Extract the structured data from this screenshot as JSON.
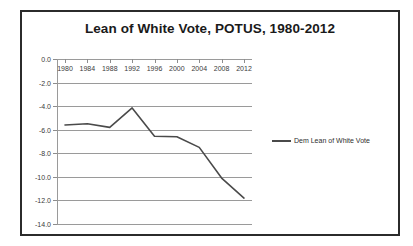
{
  "chart_data": {
    "type": "line",
    "title": "Lean of White Vote, POTUS, 1980-2012",
    "xlabel": "",
    "ylabel": "",
    "categories": [
      "1980",
      "1984",
      "1988",
      "1992",
      "1996",
      "2000",
      "2004",
      "2008",
      "2012"
    ],
    "x": [
      1980,
      1984,
      1988,
      1992,
      1996,
      2000,
      2004,
      2008,
      2012
    ],
    "series": [
      {
        "name": "Dem Lean of White Vote",
        "color": "#4a4a4a",
        "values": [
          -5.6,
          -5.5,
          -5.8,
          -4.15,
          -6.55,
          -6.6,
          -7.5,
          -10.1,
          -11.8
        ]
      }
    ],
    "ylim": [
      -14.0,
      0.0
    ],
    "y_ticks": [
      0.0,
      -2.0,
      -4.0,
      -6.0,
      -8.0,
      -10.0,
      -12.0,
      -14.0
    ],
    "y_tick_labels": [
      "0.0",
      "-2.0",
      "-4.0",
      "-6.0",
      "-8.0",
      "-10.0",
      "-12.0",
      "-14.0"
    ],
    "grid": true,
    "legend_position": "right",
    "legend_entries": [
      "Dem Lean of White Vote"
    ]
  },
  "legend": {
    "entry_label": "Dem Lean of White Vote"
  }
}
